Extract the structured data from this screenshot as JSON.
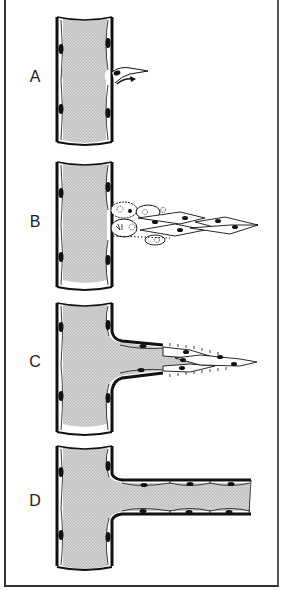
{
  "figure": {
    "panels": [
      {
        "label": "A",
        "stage": "endothelial cell sprouting from vessel wall"
      },
      {
        "label": "B",
        "stage": "migrating and proliferating endothelial cells"
      },
      {
        "label": "C",
        "stage": "lumen formation in sprout"
      },
      {
        "label": "D",
        "stage": "mature capillary branch"
      }
    ]
  },
  "colors": {
    "lumen": "#c8c8c8",
    "wall": "#111111",
    "nucleus": "#111111",
    "background": "#ffffff",
    "frame": "#333333"
  }
}
